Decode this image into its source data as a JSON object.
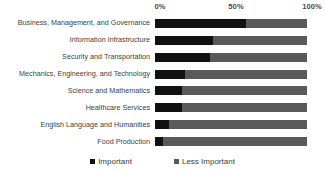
{
  "chart_data": {
    "type": "bar",
    "title": "",
    "subtitle": "",
    "xlabel": "",
    "ylabel": "",
    "orientation": "horizontal",
    "stacked": true,
    "normalized": true,
    "grid": false,
    "legend_position": "bottom",
    "xlim": [
      0,
      100
    ],
    "xticks": [
      "0%",
      "50%",
      "100%"
    ],
    "xtick_values": [
      0,
      50,
      100
    ],
    "categories": [
      "Business,  Management, and Governance",
      "Information Infrastructure",
      "Security and Transportation",
      "Mechanics, Engineering, and Technology",
      "Science and Mathematics",
      "Healthcare Services",
      "English Language and Humanities",
      "Food Production"
    ],
    "series": [
      {
        "name": "Important",
        "color": "#111111",
        "values": [
          60,
          38,
          36,
          20,
          18,
          18,
          9,
          5
        ]
      },
      {
        "name": "Less Important",
        "color": "#595959",
        "values": [
          40,
          62,
          64,
          80,
          82,
          82,
          91,
          95
        ]
      }
    ]
  },
  "legend": {
    "items": [
      {
        "label": "Important",
        "swatch": "important"
      },
      {
        "label": "Less Important",
        "swatch": "less"
      }
    ]
  }
}
